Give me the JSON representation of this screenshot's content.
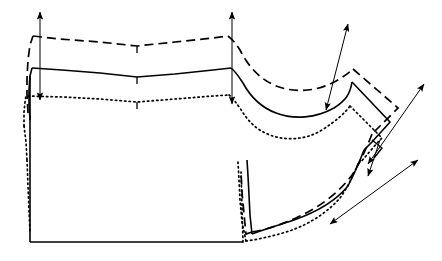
{
  "document": {
    "title": "Pattern Grading Diagram",
    "subject": "garment-bodice-front-pattern",
    "background_color": "#ffffff",
    "line_color": "#000000",
    "width": 442,
    "height": 261
  },
  "legend": {
    "base_style": "solid",
    "grade_up_style": "dashed",
    "grade_down_style": "dotted",
    "base_label": "base size",
    "grade_up_label": "graded up",
    "grade_down_label": "graded down"
  },
  "chart_data": {
    "type": "line",
    "xlabel": "",
    "ylabel": "",
    "xlim": [
      0,
      442
    ],
    "ylim": [
      0,
      261
    ],
    "grid": false,
    "legend_position": "none",
    "series": [
      {
        "name": "graded up",
        "style": "dashed",
        "points": [
          [
            28,
            113
          ],
          [
            27,
            95
          ],
          [
            27,
            78
          ],
          [
            28,
            60
          ],
          [
            30,
            45
          ],
          [
            33,
            36
          ],
          [
            60,
            39
          ],
          [
            100,
            42
          ],
          [
            137,
            46
          ],
          [
            175,
            42
          ],
          [
            213,
            38
          ],
          [
            228,
            36
          ],
          [
            237,
            38
          ],
          [
            247,
            52
          ],
          [
            258,
            70
          ],
          [
            272,
            83
          ],
          [
            290,
            90
          ],
          [
            310,
            92
          ],
          [
            330,
            86
          ],
          [
            345,
            77
          ],
          [
            353,
            69
          ],
          [
            398,
            108
          ],
          [
            386,
            120
          ],
          [
            372,
            134
          ],
          [
            352,
            175
          ],
          [
            332,
            200
          ],
          [
            312,
            213
          ],
          [
            292,
            221
          ],
          [
            272,
            227
          ],
          [
            252,
            232
          ],
          [
            246,
            234
          ],
          [
            244,
            214
          ],
          [
            242,
            192
          ],
          [
            241,
            172
          ]
        ]
      },
      {
        "name": "base size",
        "style": "solid",
        "points": [
          [
            30,
            120
          ],
          [
            29,
            104
          ],
          [
            29,
            90
          ],
          [
            30,
            76
          ],
          [
            32,
            68
          ],
          [
            62,
            70
          ],
          [
            100,
            73
          ],
          [
            137,
            77
          ],
          [
            175,
            74
          ],
          [
            213,
            70
          ],
          [
            231,
            68
          ],
          [
            240,
            72
          ],
          [
            250,
            86
          ],
          [
            262,
            100
          ],
          [
            278,
            110
          ],
          [
            296,
            114
          ],
          [
            314,
            112
          ],
          [
            330,
            104
          ],
          [
            344,
            92
          ],
          [
            352,
            82
          ],
          [
            390,
            122
          ],
          [
            378,
            136
          ],
          [
            364,
            150
          ],
          [
            348,
            186
          ],
          [
            328,
            206
          ],
          [
            306,
            216
          ],
          [
            286,
            223
          ],
          [
            266,
            229
          ],
          [
            252,
            234
          ],
          [
            250,
            215
          ],
          [
            249,
            195
          ],
          [
            248,
            176
          ],
          [
            247,
            160
          ]
        ]
      },
      {
        "name": "graded down",
        "style": "dotted",
        "points": [
          [
            24,
            126
          ],
          [
            24,
            112
          ],
          [
            25,
            102
          ],
          [
            26,
            96
          ],
          [
            62,
            97
          ],
          [
            100,
            99
          ],
          [
            137,
            102
          ],
          [
            175,
            99
          ],
          [
            213,
            96
          ],
          [
            229,
            95
          ],
          [
            238,
            100
          ],
          [
            248,
            114
          ],
          [
            260,
            126
          ],
          [
            276,
            134
          ],
          [
            294,
            138
          ],
          [
            312,
            136
          ],
          [
            328,
            128
          ],
          [
            342,
            116
          ],
          [
            350,
            106
          ],
          [
            382,
            138
          ],
          [
            372,
            150
          ],
          [
            358,
            164
          ],
          [
            342,
            196
          ],
          [
            322,
            214
          ],
          [
            300,
            224
          ],
          [
            280,
            231
          ],
          [
            262,
            237
          ],
          [
            246,
            241
          ],
          [
            242,
            222
          ],
          [
            240,
            200
          ],
          [
            239,
            180
          ],
          [
            238,
            162
          ]
        ]
      }
    ],
    "structural_paths": [
      {
        "name": "center-front-edge",
        "style": "solid",
        "points": [
          [
            30,
            76
          ],
          [
            30,
            242
          ]
        ]
      },
      {
        "name": "hem-line",
        "style": "solid",
        "points": [
          [
            30,
            242
          ],
          [
            243,
            242
          ]
        ]
      },
      {
        "name": "side-seam-drop",
        "style": "dotted",
        "points": [
          [
            243,
            242
          ],
          [
            241,
            172
          ]
        ]
      }
    ],
    "grade_arrows": [
      {
        "name": "center-front-vertical-grade",
        "x1": 40,
        "y1": 10,
        "x2": 40,
        "y2": 100,
        "double_headed": true,
        "orientation": "vertical"
      },
      {
        "name": "shoulder-neck-vertical-grade",
        "x1": 232,
        "y1": 10,
        "x2": 232,
        "y2": 104,
        "double_headed": true,
        "orientation": "vertical"
      },
      {
        "name": "shoulder-tip-diagonal-grade",
        "x1": 348,
        "y1": 22,
        "x2": 325,
        "y2": 112,
        "double_headed": true,
        "orientation": "diagonal"
      },
      {
        "name": "armhole-outer-diagonal-grade",
        "x1": 424,
        "y1": 82,
        "x2": 366,
        "y2": 166,
        "double_headed": true,
        "orientation": "diagonal"
      },
      {
        "name": "underarm-diagonal-grade",
        "x1": 418,
        "y1": 160,
        "x2": 328,
        "y2": 226,
        "double_headed": true,
        "orientation": "diagonal"
      },
      {
        "name": "armhole-inner-short-grade",
        "x1": 378,
        "y1": 146,
        "x2": 366,
        "y2": 178,
        "double_headed": false,
        "orientation": "diagonal"
      }
    ],
    "notches": [
      {
        "name": "neckline-vertex-notch-up",
        "x": 137,
        "y": 46
      },
      {
        "name": "neckline-vertex-notch-base",
        "x": 137,
        "y": 77
      },
      {
        "name": "neckline-vertex-notch-down",
        "x": 137,
        "y": 102
      },
      {
        "name": "armhole-right-angle-notch",
        "x": 378,
        "y": 148
      }
    ],
    "annotations": []
  }
}
